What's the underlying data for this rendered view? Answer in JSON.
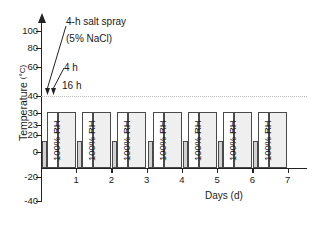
{
  "chart_data": {
    "type": "bar",
    "title": "",
    "xlabel": "Days (d)",
    "ylabel": "Temperature",
    "ylabel_unit": "(°C)",
    "xlim": [
      0,
      7.5
    ],
    "ylim": [
      -40,
      110
    ],
    "grid": true,
    "gridlines": [
      40
    ],
    "legend_position": "none",
    "x_ticks": [
      1,
      2,
      3,
      4,
      5,
      6,
      7
    ],
    "x_tick_labels": [
      "1",
      "2",
      "3",
      "4",
      "5",
      "6",
      "7"
    ],
    "y_ticks": [
      100,
      80,
      60,
      40,
      30,
      23,
      20,
      0,
      -20,
      -40
    ],
    "y_tick_labels": [
      "100",
      "80",
      "60",
      "40",
      "30",
      "23",
      "20",
      "0",
      "-20",
      "-40"
    ],
    "y_axis_note": "non-uniform axis: 40/30/23/20 cluster is compressed",
    "categories": [
      "Day 1",
      "Day 2",
      "Day 3",
      "Day 4",
      "Day 5",
      "Day 6",
      "Day 7"
    ],
    "series": [
      {
        "name": "16 h condensation (100% RH)",
        "bar_label": "100% RH",
        "values": [
          40,
          40,
          40,
          40,
          40,
          40,
          40
        ],
        "fill": "#efefef",
        "edge": "#4a4a4a"
      },
      {
        "name": "4 h dry",
        "bar_label": "",
        "values": [
          40,
          40,
          40,
          40,
          40,
          40,
          40
        ],
        "fill": "#ffffff",
        "edge": "#4a4a4a"
      },
      {
        "name": "4 h salt spray (5% NaCl)",
        "bar_label": "",
        "values": [
          23,
          23,
          23,
          23,
          23,
          23,
          23
        ],
        "fill": "#d3d3d3",
        "edge": "#4a4a4a"
      }
    ],
    "annotations": [
      {
        "text": "4-h  salt spray",
        "points_to": "salt-spray-arrow"
      },
      {
        "text": "(5% NaCl)",
        "points_to": "salt-spray-arrow"
      },
      {
        "text": "4 h",
        "points_to": "dry-arrow"
      },
      {
        "text": "16 h",
        "points_to": "rh-arrow"
      }
    ]
  },
  "axes": {
    "y_title": "Temperature",
    "y_unit": "(°C)",
    "x_title": "Days (d)"
  },
  "annotations": {
    "salt_spray": "4-h  salt spray",
    "nacl": "(5% NaCl)",
    "four_hour": "4 h",
    "sixteen_hour": "16 h"
  },
  "bar_text": "100% RH"
}
